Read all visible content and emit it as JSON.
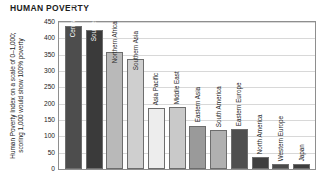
{
  "title": "HUMAN POVERTY",
  "y_axis_title": "Human Poverty Index on a scale of 0–1,000;\nscoring 1,000 would show 100% poverty",
  "chart_data": {
    "type": "bar",
    "title": "HUMAN POVERTY",
    "xlabel": "",
    "ylabel": "Human Poverty Index on a scale of 0–1,000; scoring 1,000 would show 100% poverty",
    "ylim": [
      0,
      450
    ],
    "ytick_labels": [
      "450",
      "400",
      "350",
      "300",
      "250",
      "200",
      "150",
      "100",
      "50",
      "0"
    ],
    "ytick_values": [
      450,
      400,
      350,
      300,
      250,
      200,
      150,
      100,
      50,
      0
    ],
    "grid": true,
    "legend": "none",
    "categories": [
      "Central Africa",
      "Southern Africa",
      "Northern Africa",
      "Southern Asia",
      "Asia Pacific",
      "Middle East",
      "Eastern Asia",
      "South America",
      "Eastern Europe",
      "North America",
      "Western Europe",
      "Japan"
    ],
    "values": [
      437,
      425,
      357,
      337,
      187,
      190,
      133,
      119,
      122,
      36,
      14,
      14
    ],
    "bar_colors": [
      "#4d4d4d",
      "#3a3a3a",
      "#b9b9b9",
      "#cfcfcf",
      "#ededed",
      "#c9c9c9",
      "#9a9a9a",
      "#b0b0b0",
      "#4f4f4f",
      "#3f3f3f",
      "#4a4a4a",
      "#3d3d3d"
    ],
    "label_placement": [
      "inside-light",
      "inside-light",
      "inside-dark",
      "inside-dark",
      "above",
      "above",
      "above",
      "above",
      "above",
      "above",
      "above",
      "above"
    ]
  }
}
